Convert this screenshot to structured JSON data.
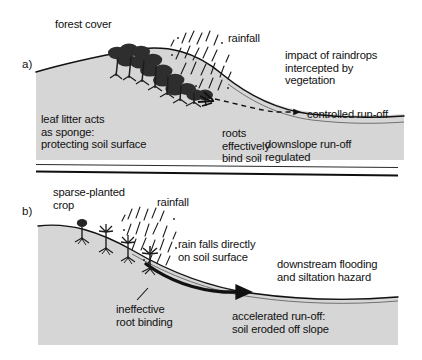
{
  "diagram": {
    "title_visible": false,
    "colors": {
      "soil_fill": "#d6d6d6",
      "ink": "#111111",
      "vegetation": "#2b2b2b",
      "page_background": "#ffffff"
    }
  },
  "panel_a": {
    "tag": "a)",
    "labels": {
      "forest_cover": "forest cover",
      "rainfall": "rainfall",
      "impact": "impact of raindrops\nintercepted by\nvegetation",
      "controlled_runoff": "controlled run-off",
      "leaf_litter": "leaf litter acts\nas sponge:\nprotecting soil surface",
      "roots": "roots\neffectively\nbind soil",
      "downslope": "downslope run-off\nregulated"
    },
    "features": {
      "vegetation": "dense forest canopy row on slope",
      "rain": "slanted rain strokes",
      "runoff_arrow_style": "dashed"
    }
  },
  "panel_b": {
    "tag": "b)",
    "labels": {
      "sparse_crop": "sparse-planted\ncrop",
      "rainfall": "rainfall",
      "rain_direct": "rain falls directly\non soil surface",
      "downstream": "downstream flooding\nand siltation hazard",
      "ineffective_roots": "ineffective\nroot binding",
      "accelerated": "accelerated run-off:\nsoil eroded off slope"
    },
    "features": {
      "vegetation": "four sparse crop plants with thin stems",
      "rain": "slanted rain strokes reaching soil",
      "runoff_arrow_style": "thick solid"
    }
  },
  "dividers": {
    "count": 2,
    "description": "two horizontal rules separating panel a from panel b"
  }
}
